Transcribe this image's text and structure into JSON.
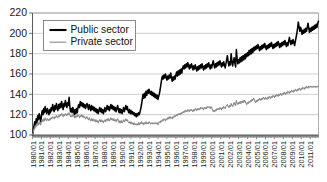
{
  "chart_data": {
    "type": "line",
    "title": "",
    "subtitle": "",
    "xlabel": "",
    "ylabel": "",
    "ylim": [
      100,
      220
    ],
    "ytick_values": [
      100,
      120,
      140,
      160,
      180,
      200,
      220
    ],
    "ytick_labels": [
      "100",
      "120",
      "140",
      "160",
      "180",
      "200",
      "220"
    ],
    "grid": true,
    "legend_position": "upper-left",
    "x_start": "1980/01",
    "x_end": "2011/12",
    "x_frequency": "monthly",
    "xtick_labels": [
      "1980/01",
      "1981/01",
      "1982/01",
      "1983/01",
      "1984/01",
      "1985/01",
      "1986/01",
      "1987/01",
      "1988/01",
      "1989/01",
      "1990/01",
      "1991/01",
      "1992/01",
      "1993/01",
      "1994/01",
      "1995/01",
      "1996/01",
      "1997/01",
      "1998/01",
      "1999/01",
      "2000/01",
      "2001/01",
      "2002/01",
      "2003/01",
      "2004/01",
      "2005/01",
      "2006/01",
      "2007/01",
      "2008/01",
      "2009/01",
      "2010/01",
      "2011/01"
    ],
    "series": [
      {
        "name": "Public sector",
        "color": "#000000",
        "values": [
          100,
          104,
          109,
          113,
          110,
          116,
          112,
          119,
          115,
          121,
          117,
          113,
          119,
          124,
          120,
          126,
          122,
          128,
          124,
          121,
          126,
          123,
          120,
          125,
          122,
          127,
          124,
          130,
          126,
          123,
          129,
          125,
          131,
          127,
          124,
          130,
          126,
          131,
          127,
          133,
          129,
          125,
          131,
          128,
          134,
          130,
          127,
          132,
          129,
          137,
          128,
          123,
          126,
          122,
          127,
          124,
          120,
          125,
          121,
          126,
          122,
          128,
          130,
          127,
          133,
          129,
          132,
          128,
          131,
          127,
          130,
          126,
          129,
          131,
          128,
          125,
          130,
          127,
          124,
          129,
          125,
          128,
          124,
          127,
          123,
          126,
          122,
          125,
          121,
          124,
          127,
          123,
          126,
          122,
          125,
          121,
          124,
          127,
          123,
          126,
          129,
          125,
          128,
          124,
          127,
          130,
          126,
          129,
          125,
          128,
          124,
          127,
          123,
          126,
          129,
          125,
          122,
          126,
          122,
          125,
          121,
          124,
          127,
          123,
          126,
          129,
          125,
          128,
          124,
          122,
          125,
          121,
          124,
          121,
          123,
          120,
          122,
          119,
          121,
          118,
          121,
          119,
          122,
          120,
          123,
          126,
          130,
          135,
          140,
          136,
          141,
          137,
          143,
          139,
          144,
          141,
          145,
          142,
          140,
          143,
          139,
          142,
          138,
          141,
          137,
          140,
          136,
          139,
          135,
          138,
          141,
          145,
          150,
          155,
          158,
          155,
          159,
          156,
          160,
          157,
          154,
          158,
          155,
          159,
          156,
          161,
          157,
          153,
          157,
          154,
          158,
          155,
          159,
          162,
          158,
          163,
          159,
          164,
          160,
          165,
          161,
          166,
          168,
          165,
          169,
          166,
          170,
          167,
          171,
          168,
          165,
          169,
          166,
          170,
          167,
          164,
          168,
          165,
          169,
          166,
          163,
          167,
          164,
          168,
          165,
          169,
          166,
          170,
          167,
          164,
          168,
          165,
          169,
          166,
          170,
          167,
          171,
          168,
          165,
          169,
          166,
          170,
          173,
          169,
          166,
          170,
          167,
          171,
          168,
          172,
          169,
          173,
          170,
          167,
          171,
          168,
          172,
          169,
          166,
          170,
          174,
          178,
          172,
          168,
          172,
          169,
          180,
          173,
          168,
          172,
          176,
          171,
          167,
          184,
          175,
          170,
          174,
          171,
          176,
          172,
          177,
          173,
          178,
          174,
          179,
          175,
          180,
          177,
          181,
          178,
          183,
          179,
          184,
          180,
          185,
          181,
          186,
          183,
          187,
          184,
          188,
          185,
          189,
          186,
          183,
          187,
          184,
          188,
          185,
          189,
          186,
          190,
          187,
          184,
          188,
          185,
          189,
          186,
          190,
          187,
          191,
          188,
          185,
          189,
          186,
          190,
          187,
          191,
          188,
          192,
          189,
          186,
          190,
          187,
          191,
          188,
          192,
          189,
          193,
          190,
          187,
          191,
          188,
          192,
          196,
          192,
          189,
          193,
          190,
          194,
          191,
          188,
          192,
          196,
          200,
          205,
          211,
          206,
          202,
          206,
          203,
          199,
          203,
          200,
          204,
          201,
          205,
          202,
          206,
          210,
          205,
          201,
          205,
          202,
          206,
          203,
          207,
          204,
          208,
          205,
          209,
          206,
          210,
          212
        ]
      },
      {
        "name": "Private sector",
        "color": "#8a8a8a",
        "values": [
          100,
          103,
          106,
          108,
          107,
          110,
          109,
          112,
          110,
          113,
          111,
          110,
          113,
          115,
          113,
          116,
          114,
          117,
          115,
          114,
          116,
          115,
          114,
          116,
          115,
          117,
          116,
          118,
          117,
          116,
          118,
          117,
          119,
          118,
          117,
          119,
          118,
          120,
          119,
          121,
          120,
          118,
          120,
          119,
          121,
          120,
          119,
          121,
          120,
          122,
          120,
          118,
          119,
          118,
          120,
          119,
          117,
          119,
          117,
          119,
          118,
          120,
          119,
          117,
          119,
          118,
          120,
          118,
          119,
          117,
          118,
          116,
          117,
          118,
          116,
          115,
          117,
          115,
          114,
          116,
          114,
          116,
          114,
          115,
          113,
          115,
          113,
          114,
          112,
          114,
          115,
          113,
          115,
          113,
          114,
          112,
          114,
          115,
          113,
          115,
          116,
          114,
          116,
          114,
          115,
          117,
          115,
          116,
          114,
          116,
          114,
          115,
          113,
          115,
          116,
          114,
          112,
          114,
          112,
          114,
          112,
          113,
          115,
          113,
          114,
          116,
          114,
          115,
          113,
          112,
          113,
          111,
          113,
          111,
          112,
          110,
          112,
          110,
          111,
          110,
          111,
          110,
          112,
          110,
          112,
          111,
          113,
          111,
          112,
          110,
          112,
          111,
          113,
          111,
          112,
          111,
          113,
          112,
          111,
          112,
          111,
          112,
          111,
          112,
          111,
          112,
          111,
          112,
          110,
          112,
          113,
          112,
          114,
          113,
          115,
          114,
          116,
          115,
          114,
          116,
          115,
          117,
          116,
          118,
          116,
          118,
          117,
          116,
          118,
          117,
          119,
          118,
          119,
          120,
          119,
          121,
          120,
          121,
          120,
          122,
          121,
          122,
          123,
          122,
          124,
          123,
          124,
          123,
          125,
          124,
          123,
          125,
          124,
          125,
          124,
          123,
          125,
          124,
          126,
          125,
          124,
          126,
          125,
          126,
          125,
          127,
          126,
          127,
          126,
          125,
          127,
          126,
          127,
          126,
          128,
          127,
          128,
          127,
          126,
          128,
          127,
          125,
          123,
          124,
          123,
          125,
          124,
          126,
          125,
          126,
          125,
          127,
          126,
          125,
          127,
          126,
          128,
          127,
          126,
          128,
          129,
          130,
          128,
          127,
          129,
          128,
          131,
          129,
          128,
          130,
          132,
          130,
          129,
          134,
          131,
          130,
          132,
          131,
          133,
          131,
          133,
          132,
          134,
          132,
          134,
          133,
          131,
          130,
          132,
          131,
          133,
          132,
          134,
          133,
          135,
          134,
          136,
          135,
          133,
          132,
          134,
          133,
          135,
          134,
          136,
          135,
          134,
          136,
          135,
          137,
          136,
          135,
          137,
          136,
          135,
          137,
          136,
          138,
          137,
          136,
          138,
          137,
          139,
          138,
          137,
          139,
          138,
          140,
          139,
          138,
          140,
          139,
          141,
          140,
          139,
          141,
          140,
          142,
          141,
          140,
          142,
          141,
          143,
          142,
          141,
          143,
          142,
          144,
          143,
          142,
          144,
          143,
          145,
          144,
          143,
          145,
          144,
          146,
          145,
          144,
          146,
          145,
          147,
          146,
          145,
          147,
          146,
          148,
          147,
          146,
          148,
          147,
          148,
          147,
          148,
          147,
          148,
          147,
          148,
          147,
          148,
          147,
          148,
          148
        ]
      }
    ]
  },
  "legend": {
    "entries": [
      {
        "label": "Public sector",
        "color": "#000000"
      },
      {
        "label": "Private sector",
        "color": "#9a9a9a"
      }
    ]
  }
}
